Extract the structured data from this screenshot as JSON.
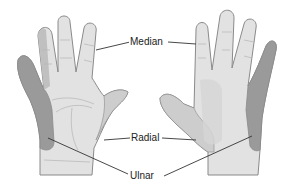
{
  "diagram": {
    "type": "anatomical-nerve-distribution",
    "views": [
      {
        "name": "palmar",
        "position": "left"
      },
      {
        "name": "dorsal",
        "position": "right"
      }
    ],
    "labels": {
      "median": "Median",
      "radial": "Radial",
      "ulnar": "Ulnar"
    },
    "colors": {
      "median": "#e2e2e2",
      "radial": "#cdcdcd",
      "ulnar": "#9a9a9a",
      "outline": "#8a8a8a",
      "background": "#ffffff",
      "leader_line": "#333333"
    }
  }
}
